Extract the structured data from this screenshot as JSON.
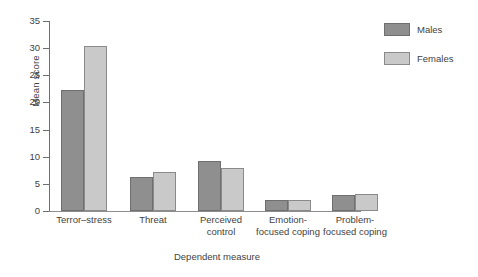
{
  "chart_data": {
    "type": "bar",
    "title": "",
    "subtitle": "",
    "xlabel": "Dependent measure",
    "ylabel": "Mean score",
    "categories": [
      "Terror–stress",
      "Threat",
      "Perceived control",
      "Emotion-focused coping",
      "Problem-focused coping"
    ],
    "category_label_lines": [
      [
        "Terror–stress"
      ],
      [
        "Threat"
      ],
      [
        "Perceived",
        "control"
      ],
      [
        "Emotion-",
        "focused coping"
      ],
      [
        "Problem-",
        "focused coping"
      ]
    ],
    "series": [
      {
        "name": "Males",
        "color": "#8f8f8f",
        "values": [
          22.3,
          6.3,
          9.3,
          2.0,
          2.9
        ]
      },
      {
        "name": "Females",
        "color": "#c9c9c9",
        "values": [
          30.4,
          7.2,
          7.9,
          2.1,
          3.2
        ]
      }
    ],
    "ylim": [
      0,
      35
    ],
    "yticks": [
      0,
      5,
      10,
      15,
      20,
      25,
      30,
      35
    ],
    "ytick_labels": [
      "0",
      "5",
      "10",
      "15",
      "20",
      "25",
      "30",
      "35"
    ],
    "grid": false,
    "legend_position": "top-right",
    "legend_entries": [
      "Males",
      "Females"
    ]
  },
  "colors": {
    "males": "#8f8f8f",
    "females": "#c9c9c9",
    "axis": "#6e6e6e",
    "text": "#3f3f3f",
    "background": "#ffffff"
  }
}
